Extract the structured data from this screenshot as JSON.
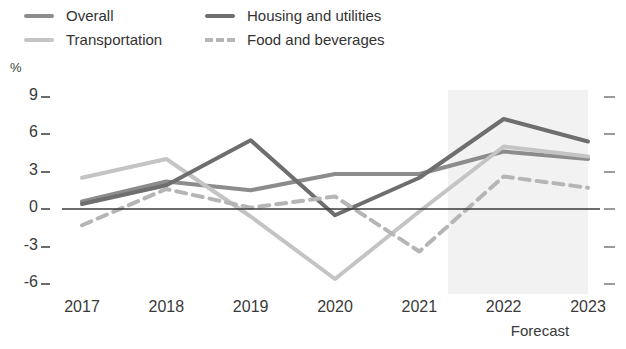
{
  "legend": {
    "items": [
      {
        "label": "Overall",
        "color": "#8c8c8c",
        "style": "solid"
      },
      {
        "label": "Transportation",
        "color": "#c4c4c4",
        "style": "solid"
      },
      {
        "label": "Housing and utilities",
        "color": "#6e6e6e",
        "style": "solid"
      },
      {
        "label": "Food and beverages",
        "color": "#b5b5b5",
        "style": "dashed"
      }
    ]
  },
  "axis": {
    "y_unit": "%",
    "y_ticks": [
      "9",
      "6",
      "3",
      "0",
      "-3",
      "-6"
    ],
    "x_ticks": [
      "2017",
      "2018",
      "2019",
      "2020",
      "2021",
      "2022",
      "2023"
    ],
    "forecast_caption": "Forecast"
  },
  "chart_data": {
    "type": "line",
    "title": "",
    "xlabel": "",
    "ylabel": "%",
    "ylim": [
      -7.5,
      9.8
    ],
    "yticks": [
      9,
      6,
      3,
      0,
      -3,
      -6
    ],
    "grid": false,
    "legend_position": "top",
    "categories": [
      "2017",
      "2018",
      "2019",
      "2020",
      "2021",
      "2022",
      "2023"
    ],
    "forecast_from": "2022",
    "series": [
      {
        "name": "Overall",
        "color": "#8c8c8c",
        "style": "solid",
        "values": [
          0.6,
          2.2,
          1.5,
          2.8,
          2.8,
          4.6,
          4.0
        ]
      },
      {
        "name": "Transportation",
        "color": "#c4c4c4",
        "style": "solid",
        "values": [
          2.5,
          4.0,
          -0.6,
          -5.6,
          -0.2,
          5.0,
          4.2
        ]
      },
      {
        "name": "Housing and utilities",
        "color": "#6e6e6e",
        "style": "solid",
        "values": [
          0.4,
          1.9,
          5.5,
          -0.5,
          2.5,
          7.2,
          5.4
        ]
      },
      {
        "name": "Food and beverages",
        "color": "#b5b5b5",
        "style": "dashed",
        "values": [
          -1.3,
          1.6,
          0.1,
          1.0,
          -3.4,
          2.6,
          1.7
        ]
      }
    ]
  },
  "colors": {
    "forecast_band": "#f2f2f2",
    "zero_line": "#3a3a3a",
    "tick": "#6b6b6b",
    "right_tick": "#9a9a9a",
    "text": "#3a3a3a"
  }
}
